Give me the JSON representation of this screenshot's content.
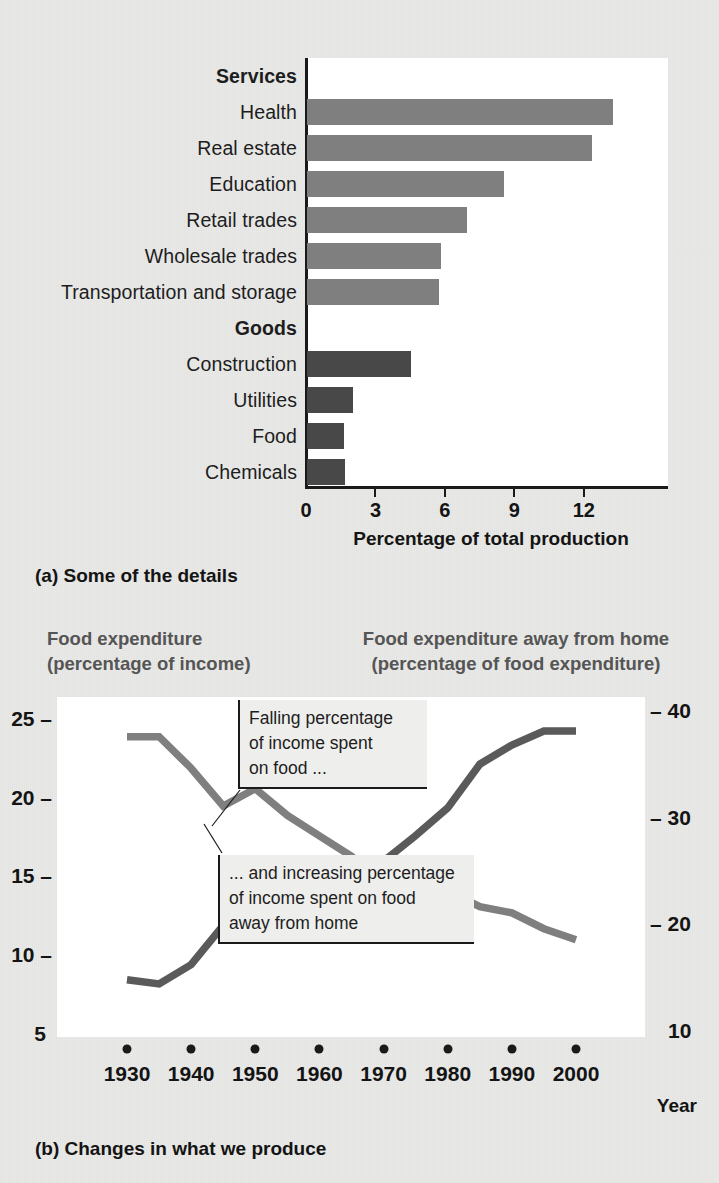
{
  "chart_data": [
    {
      "type": "bar",
      "orientation": "horizontal",
      "title": "",
      "xlabel": "Percentage of total production",
      "ylabel": "",
      "xlim": [
        0,
        15.7
      ],
      "xticks": [
        0,
        3,
        6,
        9,
        12
      ],
      "grid": false,
      "groups": [
        {
          "name": "Services",
          "color": "#7f7f7f"
        },
        {
          "name": "Goods",
          "color": "#484848"
        }
      ],
      "rows": [
        {
          "label": "Services",
          "kind": "group-header",
          "value": null
        },
        {
          "label": "Health",
          "kind": "bar",
          "group": "Services",
          "value": 13.2
        },
        {
          "label": "Real estate",
          "kind": "bar",
          "group": "Services",
          "value": 12.3
        },
        {
          "label": "Education",
          "kind": "bar",
          "group": "Services",
          "value": 8.5
        },
        {
          "label": "Retail trades",
          "kind": "bar",
          "group": "Services",
          "value": 6.9
        },
        {
          "label": "Wholesale trades",
          "kind": "bar",
          "group": "Services",
          "value": 5.8
        },
        {
          "label": "Transportation and storage",
          "kind": "bar",
          "group": "Services",
          "value": 5.7
        },
        {
          "label": "Goods",
          "kind": "group-header",
          "value": null
        },
        {
          "label": "Construction",
          "kind": "bar",
          "group": "Goods",
          "value": 4.5
        },
        {
          "label": "Utilities",
          "kind": "bar",
          "group": "Goods",
          "value": 2.0
        },
        {
          "label": "Food",
          "kind": "bar",
          "group": "Goods",
          "value": 1.6
        },
        {
          "label": "Chemicals",
          "kind": "bar",
          "group": "Goods",
          "value": 1.65
        }
      ],
      "caption": "(a) Some of the details"
    },
    {
      "type": "line",
      "title": "",
      "xlabel": "Year",
      "left_axis_title_line1": "Food expenditure",
      "left_axis_title_line2": "(percentage of income)",
      "right_axis_title_line1": "Food expenditure away from home",
      "right_axis_title_line2": "(percentage of food expenditure)",
      "x": [
        1930,
        1935,
        1940,
        1945,
        1950,
        1955,
        1960,
        1965,
        1970,
        1975,
        1980,
        1985,
        1990,
        1995,
        2000
      ],
      "xticks": [
        1930,
        1940,
        1950,
        1960,
        1970,
        1980,
        1990,
        2000
      ],
      "left_ylim": [
        5,
        26.0
      ],
      "left_yticks": [
        5,
        10,
        15,
        20,
        25
      ],
      "right_ylim": [
        10,
        41.4
      ],
      "right_yticks": [
        10,
        20,
        30,
        40
      ],
      "grid": false,
      "series": [
        {
          "name": "Food expenditure (percentage of income)",
          "axis": "left",
          "color": "#7f7f7f",
          "values": [
            24.0,
            24.0,
            22.0,
            19.6,
            20.7,
            19.0,
            17.7,
            16.4,
            14.6,
            14.1,
            14.2,
            13.2,
            12.8,
            11.8,
            11.1
          ]
        },
        {
          "name": "Food expenditure away from home (percentage of food expenditure)",
          "axis": "right",
          "color": "#5a5a5a",
          "values": [
            15.0,
            14.6,
            16.4,
            20.1,
            18.7,
            19.2,
            21.4,
            24.0,
            26.1,
            28.5,
            31.1,
            35.2,
            37.0,
            38.3,
            38.3
          ]
        }
      ],
      "annotations": [
        {
          "id": "callout-1",
          "lines": [
            "Falling percentage",
            "of income spent",
            "on food ..."
          ]
        },
        {
          "id": "callout-2",
          "lines": [
            "... and increasing percentage",
            "of income spent on food",
            "away from home"
          ]
        }
      ],
      "caption": "(b) Changes in what we produce"
    }
  ],
  "panel_a": {
    "xtitle": "Percentage of total production",
    "caption": "(a) Some of the details",
    "xticks": [
      "0",
      "3",
      "6",
      "9",
      "12"
    ],
    "rows": [
      {
        "label": "Services"
      },
      {
        "label": "Health"
      },
      {
        "label": "Real estate"
      },
      {
        "label": "Education"
      },
      {
        "label": "Retail trades"
      },
      {
        "label": "Wholesale trades"
      },
      {
        "label": "Transportation and storage"
      },
      {
        "label": "Goods"
      },
      {
        "label": "Construction"
      },
      {
        "label": "Utilities"
      },
      {
        "label": "Food"
      },
      {
        "label": "Chemicals"
      }
    ]
  },
  "panel_b": {
    "left_title_1": "Food expenditure",
    "left_title_2": "(percentage of income)",
    "right_title_1": "Food expenditure away from home",
    "right_title_2": "(percentage of food expenditure)",
    "left_ticks": [
      "25",
      "20",
      "15",
      "10",
      "5"
    ],
    "right_ticks": [
      "40",
      "30",
      "20",
      "10"
    ],
    "xlabels": [
      "1930",
      "1940",
      "1950",
      "1960",
      "1970",
      "1980",
      "1990",
      "2000"
    ],
    "year_label": "Year",
    "caption": "(b) Changes in what we produce",
    "callout_1": {
      "l1": "Falling percentage",
      "l2": "of income spent",
      "l3": "on food ..."
    },
    "callout_2": {
      "l1": "... and increasing percentage",
      "l2": "of income spent on food",
      "l3": "away from home"
    }
  },
  "colors": {
    "services_bar": "#7f7f7f",
    "goods_bar": "#484848",
    "line_food": "#7f7f7f",
    "line_away": "#5a5a5a",
    "page_bg": "#e9e9e7",
    "plot_bg": "#ffffff",
    "axis": "#1a1a1a",
    "axis_title": "#555555"
  }
}
